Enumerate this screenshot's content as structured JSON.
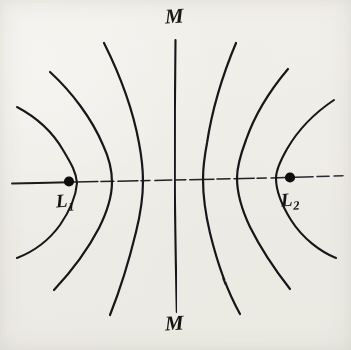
{
  "figure": {
    "background_color": "#f6f5f2",
    "ink_color": "#17161a",
    "labels": {
      "source_left": {
        "text": "L",
        "subscript": "1"
      },
      "source_right": {
        "text": "L",
        "subscript": "2"
      },
      "axis_top": "M",
      "axis_bottom": "M"
    },
    "points": [
      {
        "name": "L1",
        "x": 69,
        "y": 181,
        "radius": 5
      },
      {
        "name": "L2",
        "x": 290,
        "y": 178,
        "radius": 5
      }
    ],
    "axes": {
      "horizontal": {
        "x1": 12,
        "y1": 183,
        "x2": 344,
        "y2": 175
      },
      "vertical_m": {
        "x1": 175,
        "y1": 40,
        "x2": 177,
        "y2": 312
      }
    },
    "curves": [
      {
        "name": "left-outer",
        "vertex_x": 28,
        "crossing_y": 183,
        "top_end": [
          17,
          107
        ],
        "bottom_end": [
          17,
          258
        ]
      },
      {
        "name": "left-mid",
        "vertex_x": 95,
        "crossing_y": 182,
        "top_end": [
          50,
          72
        ],
        "bottom_end": [
          54,
          290
        ]
      },
      {
        "name": "left-inner",
        "vertex_x": 124,
        "crossing_y": 181,
        "top_end": [
          104,
          43
        ],
        "bottom_end": [
          110,
          315
        ]
      },
      {
        "name": "center-m",
        "vertex_x": 176,
        "crossing_y": 180,
        "top_end": [
          175,
          40
        ],
        "bottom_end": [
          177,
          312
        ]
      },
      {
        "name": "right-inner",
        "vertex_x": 205,
        "crossing_y": 179,
        "top_end": [
          236,
          43
        ],
        "bottom_end": [
          240,
          314
        ]
      },
      {
        "name": "right-mid",
        "vertex_x": 238,
        "crossing_y": 178,
        "top_end": [
          288,
          69
        ],
        "bottom_end": [
          290,
          289
        ]
      },
      {
        "name": "right-outer",
        "vertex_x": 262,
        "crossing_y": 177,
        "top_end": [
          334,
          100
        ],
        "bottom_end": [
          336,
          258
        ]
      }
    ],
    "counts": {
      "curve_count": 7,
      "source_count": 2,
      "axis_count": 2
    }
  }
}
